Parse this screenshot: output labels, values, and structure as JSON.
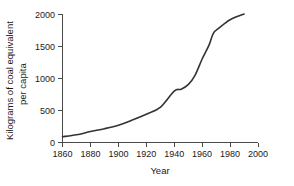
{
  "chart_data": {
    "type": "line",
    "title": "",
    "subtitle": "",
    "xlabel": "Year",
    "ylabel": "Kilograms of coal equivalent per capita",
    "ylabel_line1": "Kilograms of coal equivalent",
    "ylabel_line2": "per capita",
    "xlim": [
      1860,
      2000
    ],
    "ylim": [
      0,
      2000
    ],
    "xticks": [
      1860,
      1880,
      1900,
      1920,
      1940,
      1960,
      1980,
      2000
    ],
    "xtick_labels": [
      "1860",
      "1880",
      "1900",
      "1920",
      "1940",
      "1960",
      "1980",
      "2000"
    ],
    "yticks": [
      0,
      500,
      1000,
      1500,
      2000
    ],
    "ytick_labels": [
      "0",
      "500",
      "1000",
      "1500",
      "2000"
    ],
    "grid": false,
    "legend": null,
    "legend_position": "none",
    "line_color": "#333333",
    "axis_color": "#4a4a4a",
    "background_color": "#ffffff",
    "x": [
      1860,
      1870,
      1880,
      1890,
      1900,
      1910,
      1920,
      1930,
      1940,
      1945,
      1950,
      1955,
      1960,
      1965,
      1968,
      1972,
      1976,
      1980,
      1985,
      1990
    ],
    "values": [
      90,
      120,
      170,
      215,
      270,
      350,
      440,
      545,
      800,
      830,
      900,
      1050,
      1300,
      1520,
      1700,
      1780,
      1850,
      1910,
      1960,
      2000
    ],
    "series": [
      {
        "name": "World energy use per capita",
        "x": [
          1860,
          1870,
          1880,
          1890,
          1900,
          1910,
          1920,
          1930,
          1940,
          1945,
          1950,
          1955,
          1960,
          1965,
          1968,
          1972,
          1976,
          1980,
          1985,
          1990
        ],
        "values": [
          90,
          120,
          170,
          215,
          270,
          350,
          440,
          545,
          800,
          830,
          900,
          1050,
          1300,
          1520,
          1700,
          1780,
          1850,
          1910,
          1960,
          2000
        ]
      }
    ],
    "annotations": []
  }
}
